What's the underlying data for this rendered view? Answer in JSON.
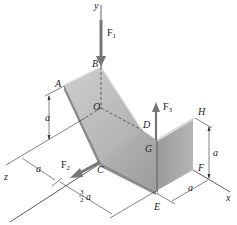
{
  "figure": {
    "type": "3D statics diagram - bent plate with forces",
    "axes": {
      "x": "x",
      "y": "y",
      "z": "z"
    },
    "points": {
      "A": "A",
      "B": "B",
      "C": "C",
      "D": "D",
      "E": "E",
      "F": "F",
      "G": "G",
      "H": "H",
      "O": "O"
    },
    "forces": {
      "F1": {
        "base": "F",
        "sub": "1"
      },
      "F2": {
        "base": "F",
        "sub": "2"
      },
      "F3": {
        "base": "F",
        "sub": "3"
      }
    },
    "dimensions": {
      "vertical_left": "a",
      "z_offset": "a",
      "x_offset_frac_num": "3",
      "x_offset_frac_den": "2",
      "x_offset_var": "a",
      "vertical_right": "a",
      "right_offset": "a"
    },
    "colors": {
      "plate_light": "#c9c9c9",
      "plate_mid": "#a9a9a9",
      "plate_dark": "#8f8f8f",
      "edge": "#d8d8d8",
      "line": "#333333",
      "arrow": "#7f7f7f"
    }
  }
}
